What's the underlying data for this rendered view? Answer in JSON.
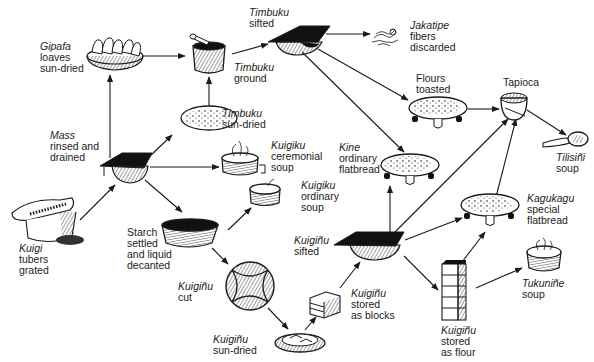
{
  "nodes": {
    "gipafa": {
      "name": "Gipafa",
      "desc1": "loaves",
      "desc2": "sun-dried"
    },
    "timbuku_ground": {
      "name": "Timbuku",
      "desc1": "ground"
    },
    "timbuku_sifted": {
      "name": "Timbuku",
      "desc1": "sifted"
    },
    "jakatipe": {
      "name": "Jakatipe",
      "desc1": "fibers",
      "desc2": "discarded"
    },
    "flours_toasted": {
      "desc1": "Flours",
      "desc2": "toasted"
    },
    "tapioca": {
      "desc1": "Tapioca"
    },
    "tilisini": {
      "name": "Tilisiñi",
      "desc1": "soup"
    },
    "timbuku_sundried": {
      "name": "Timbuku",
      "desc1": "sun-dried"
    },
    "mass": {
      "name": "Mass",
      "desc1": "rinsed and",
      "desc2": "drained"
    },
    "kuigiku_ceremonial": {
      "name": "Kuigiku",
      "desc1": "ceremonial",
      "desc2": "soup"
    },
    "kine": {
      "name": "Kine",
      "desc1": "ordinary",
      "desc2": "flatbread"
    },
    "kuigiku_ordinary": {
      "name": "Kuigiku",
      "desc1": "ordinary",
      "desc2": "soup"
    },
    "kuigi": {
      "name": "Kuigi",
      "desc1": "tubers",
      "desc2": "grated"
    },
    "starch": {
      "desc1": "Starch",
      "desc2": "settled",
      "desc3": "and liquid",
      "desc4": "decanted"
    },
    "kuiginu_sifted": {
      "name": "Kuigiñu",
      "desc1": "sifted"
    },
    "kagukagu": {
      "name": "Kagukagu",
      "desc1": "special",
      "desc2": "flatbread"
    },
    "kuiginu_cut": {
      "name": "Kuigiñu",
      "desc1": "cut"
    },
    "kuiginu_blocks": {
      "name": "Kuigiñu",
      "desc1": "stored",
      "desc2": "as blocks"
    },
    "tukunine": {
      "name": "Tukuniñe",
      "desc1": "soup"
    },
    "kuiginu_flour": {
      "name": "Kuigiñu",
      "desc1": "stored",
      "desc2": "as flour"
    },
    "kuiginu_sundried": {
      "name": "Kuigiñu",
      "desc1": "sun-dried"
    }
  },
  "edges": [
    [
      "kuigi",
      "mass"
    ],
    [
      "mass",
      "gipafa"
    ],
    [
      "gipafa",
      "timbuku_ground"
    ],
    [
      "mass",
      "timbuku_sundried"
    ],
    [
      "timbuku_sundried",
      "timbuku_ground"
    ],
    [
      "timbuku_ground",
      "timbuku_sifted"
    ],
    [
      "timbuku_sifted",
      "jakatipe"
    ],
    [
      "timbuku_sifted",
      "flours_toasted"
    ],
    [
      "timbuku_sifted",
      "kine"
    ],
    [
      "flours_toasted",
      "tapioca"
    ],
    [
      "tapioca",
      "tilisini"
    ],
    [
      "mass",
      "kuigiku_ceremonial"
    ],
    [
      "mass",
      "starch"
    ],
    [
      "starch",
      "kuigiku_ordinary"
    ],
    [
      "starch",
      "kuiginu_cut"
    ],
    [
      "kuiginu_cut",
      "kuiginu_sundried"
    ],
    [
      "kuiginu_sundried",
      "kuiginu_blocks"
    ],
    [
      "kuiginu_blocks",
      "kuiginu_sifted"
    ],
    [
      "kuiginu_sifted",
      "kine"
    ],
    [
      "kuiginu_sifted",
      "tapioca"
    ],
    [
      "kuiginu_sifted",
      "kagukagu"
    ],
    [
      "kuiginu_sifted",
      "kuiginu_flour"
    ],
    [
      "kuiginu_flour",
      "kagukagu"
    ],
    [
      "kuiginu_flour",
      "tapioca"
    ],
    [
      "kuiginu_flour",
      "tukunine"
    ]
  ],
  "colors": {
    "ink": "#1a1a1a",
    "background": "#ffffff",
    "hatch": "#555555"
  }
}
